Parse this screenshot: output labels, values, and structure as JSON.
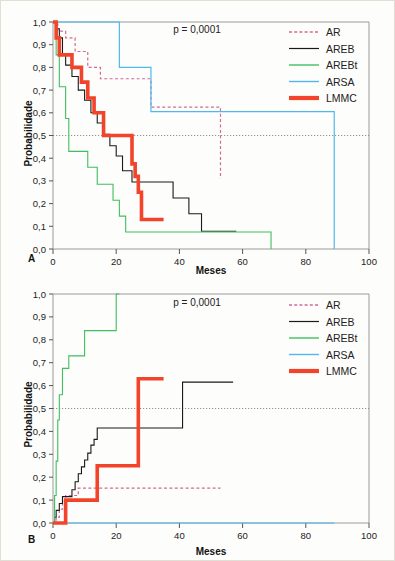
{
  "figure": {
    "background_color": "#fdfdfb",
    "border_color": "#e2ded4"
  },
  "common": {
    "xlabel": "Meses",
    "ylabel": "Probabilidade",
    "xticks": [
      "0",
      "20",
      "40",
      "60",
      "80",
      "100"
    ],
    "yticks": [
      "0,0",
      "0,1",
      "0,2",
      "0,3",
      "0,4",
      "0,5",
      "0,6",
      "0,7",
      "0,8",
      "0,9",
      "1,0"
    ],
    "pvalue": "p = 0,0001",
    "reference_line_y": 0.5,
    "legend": [
      {
        "label": "AR",
        "color": "#d4689a",
        "style": "dashed",
        "width": 1.2
      },
      {
        "label": "AREB",
        "color": "#1a1a1a",
        "style": "solid",
        "width": 1.1
      },
      {
        "label": "AREBt",
        "color": "#3fbf5f",
        "style": "solid",
        "width": 1.1
      },
      {
        "label": "ARSA",
        "color": "#4fb8ef",
        "style": "solid",
        "width": 1.2
      },
      {
        "label": "LMMC",
        "color": "#f2442a",
        "style": "solid",
        "width": 3.6
      }
    ]
  },
  "chart_data": [
    {
      "id": "panel-a",
      "panel_label": "A",
      "type": "line",
      "subtype": "kaplan-meier-step",
      "title": "",
      "xlabel": "Meses",
      "ylabel": "Probabilidade",
      "xlim": [
        0,
        100
      ],
      "ylim": [
        0,
        1
      ],
      "grid": false,
      "annotation": "p = 0,0001",
      "legend_position": "top-right",
      "series": [
        {
          "name": "AR",
          "color": "#d4689a",
          "style": "dashed",
          "points": [
            [
              0,
              1.0
            ],
            [
              1.5,
              1.0
            ],
            [
              1.5,
              0.96
            ],
            [
              4,
              0.96
            ],
            [
              4,
              0.93
            ],
            [
              7,
              0.93
            ],
            [
              7,
              0.87
            ],
            [
              11,
              0.87
            ],
            [
              11,
              0.8
            ],
            [
              15,
              0.8
            ],
            [
              15,
              0.75
            ],
            [
              31,
              0.75
            ],
            [
              31,
              0.625
            ],
            [
              53,
              0.625
            ],
            [
              53,
              0.31
            ]
          ]
        },
        {
          "name": "AREB",
          "color": "#1a1a1a",
          "style": "solid",
          "points": [
            [
              0,
              1.0
            ],
            [
              1,
              1.0
            ],
            [
              1,
              0.97
            ],
            [
              2,
              0.97
            ],
            [
              2,
              0.93
            ],
            [
              3,
              0.93
            ],
            [
              3,
              0.855
            ],
            [
              4,
              0.855
            ],
            [
              4,
              0.81
            ],
            [
              6,
              0.81
            ],
            [
              6,
              0.76
            ],
            [
              8,
              0.76
            ],
            [
              8,
              0.7
            ],
            [
              10,
              0.7
            ],
            [
              10,
              0.655
            ],
            [
              12,
              0.655
            ],
            [
              12,
              0.6
            ],
            [
              14,
              0.6
            ],
            [
              14,
              0.555
            ],
            [
              16,
              0.555
            ],
            [
              16,
              0.505
            ],
            [
              18,
              0.505
            ],
            [
              18,
              0.455
            ],
            [
              20,
              0.455
            ],
            [
              20,
              0.41
            ],
            [
              22,
              0.41
            ],
            [
              22,
              0.345
            ],
            [
              25,
              0.345
            ],
            [
              25,
              0.295
            ],
            [
              38,
              0.295
            ],
            [
              38,
              0.225
            ],
            [
              43,
              0.225
            ],
            [
              43,
              0.155
            ],
            [
              47,
              0.155
            ],
            [
              47,
              0.078
            ],
            [
              58,
              0.078
            ]
          ]
        },
        {
          "name": "AREBt",
          "color": "#3fbf5f",
          "style": "solid",
          "points": [
            [
              0,
              1.0
            ],
            [
              1,
              1.0
            ],
            [
              1,
              0.855
            ],
            [
              2,
              0.855
            ],
            [
              2,
              0.715
            ],
            [
              4,
              0.715
            ],
            [
              4,
              0.575
            ],
            [
              5,
              0.575
            ],
            [
              5,
              0.43
            ],
            [
              11,
              0.43
            ],
            [
              11,
              0.36
            ],
            [
              14,
              0.36
            ],
            [
              14,
              0.285
            ],
            [
              19,
              0.285
            ],
            [
              19,
              0.215
            ],
            [
              21,
              0.215
            ],
            [
              21,
              0.145
            ],
            [
              23,
              0.145
            ],
            [
              23,
              0.075
            ],
            [
              69,
              0.075
            ],
            [
              69,
              0.0
            ]
          ]
        },
        {
          "name": "ARSA",
          "color": "#4fb8ef",
          "style": "solid",
          "points": [
            [
              0,
              1.0
            ],
            [
              21,
              1.0
            ],
            [
              21,
              0.8
            ],
            [
              31,
              0.8
            ],
            [
              31,
              0.605
            ],
            [
              89,
              0.605
            ],
            [
              89,
              0.0
            ]
          ]
        },
        {
          "name": "LMMC",
          "color": "#f2442a",
          "style": "solid",
          "points": [
            [
              0,
              1.0
            ],
            [
              1,
              1.0
            ],
            [
              1,
              0.93
            ],
            [
              2,
              0.93
            ],
            [
              2,
              0.855
            ],
            [
              6,
              0.855
            ],
            [
              6,
              0.8
            ],
            [
              9,
              0.8
            ],
            [
              9,
              0.735
            ],
            [
              11,
              0.735
            ],
            [
              11,
              0.665
            ],
            [
              13,
              0.665
            ],
            [
              13,
              0.6
            ],
            [
              16,
              0.6
            ],
            [
              16,
              0.5
            ],
            [
              25,
              0.5
            ],
            [
              25,
              0.375
            ],
            [
              26,
              0.375
            ],
            [
              26,
              0.32
            ],
            [
              27,
              0.32
            ],
            [
              27,
              0.25
            ],
            [
              28,
              0.25
            ],
            [
              28,
              0.13
            ],
            [
              35,
              0.13
            ]
          ]
        }
      ]
    },
    {
      "id": "panel-b",
      "panel_label": "B",
      "type": "line",
      "subtype": "kaplan-meier-step",
      "title": "",
      "xlabel": "Meses",
      "ylabel": "Probabilidade",
      "xlim": [
        0,
        100
      ],
      "ylim": [
        0,
        1
      ],
      "grid": false,
      "annotation": "p = 0,0001",
      "legend_position": "top-right",
      "series": [
        {
          "name": "AR",
          "color": "#d4689a",
          "style": "dashed",
          "points": [
            [
              0,
              0.0
            ],
            [
              1,
              0.0
            ],
            [
              1,
              0.025
            ],
            [
              2,
              0.025
            ],
            [
              2,
              0.06
            ],
            [
              3,
              0.06
            ],
            [
              3,
              0.095
            ],
            [
              4,
              0.095
            ],
            [
              4,
              0.12
            ],
            [
              8,
              0.12
            ],
            [
              8,
              0.152
            ],
            [
              53,
              0.152
            ]
          ]
        },
        {
          "name": "AREB",
          "color": "#1a1a1a",
          "style": "solid",
          "points": [
            [
              0,
              0.0
            ],
            [
              0.5,
              0.0
            ],
            [
              0.5,
              0.025
            ],
            [
              1,
              0.025
            ],
            [
              1,
              0.055
            ],
            [
              2,
              0.055
            ],
            [
              2,
              0.085
            ],
            [
              3,
              0.085
            ],
            [
              3,
              0.115
            ],
            [
              6,
              0.115
            ],
            [
              6,
              0.145
            ],
            [
              7,
              0.145
            ],
            [
              7,
              0.18
            ],
            [
              8,
              0.18
            ],
            [
              8,
              0.215
            ],
            [
              9,
              0.215
            ],
            [
              9,
              0.245
            ],
            [
              10,
              0.245
            ],
            [
              10,
              0.275
            ],
            [
              11,
              0.275
            ],
            [
              11,
              0.305
            ],
            [
              12,
              0.305
            ],
            [
              12,
              0.34
            ],
            [
              13,
              0.34
            ],
            [
              13,
              0.365
            ],
            [
              14,
              0.365
            ],
            [
              14,
              0.415
            ],
            [
              41,
              0.415
            ],
            [
              41,
              0.615
            ],
            [
              57,
              0.615
            ]
          ]
        },
        {
          "name": "AREBt",
          "color": "#3fbf5f",
          "style": "solid",
          "points": [
            [
              0,
              0.0
            ],
            [
              0.5,
              0.0
            ],
            [
              0.5,
              0.12
            ],
            [
              1,
              0.12
            ],
            [
              1,
              0.27
            ],
            [
              1.5,
              0.27
            ],
            [
              1.5,
              0.45
            ],
            [
              2,
              0.45
            ],
            [
              2,
              0.56
            ],
            [
              3,
              0.56
            ],
            [
              3,
              0.675
            ],
            [
              5,
              0.675
            ],
            [
              5,
              0.73
            ],
            [
              10,
              0.73
            ],
            [
              10,
              0.84
            ],
            [
              20,
              0.84
            ],
            [
              20,
              1.0
            ],
            [
              21,
              1.0
            ]
          ]
        },
        {
          "name": "ARSA",
          "color": "#4fb8ef",
          "style": "solid",
          "points": [
            [
              0,
              0.0
            ],
            [
              89,
              0.0
            ]
          ]
        },
        {
          "name": "LMMC",
          "color": "#f2442a",
          "style": "solid",
          "points": [
            [
              0,
              0.0
            ],
            [
              4,
              0.0
            ],
            [
              4,
              0.1
            ],
            [
              14,
              0.1
            ],
            [
              14,
              0.25
            ],
            [
              27,
              0.25
            ],
            [
              27,
              0.63
            ],
            [
              35,
              0.63
            ]
          ]
        }
      ]
    }
  ]
}
